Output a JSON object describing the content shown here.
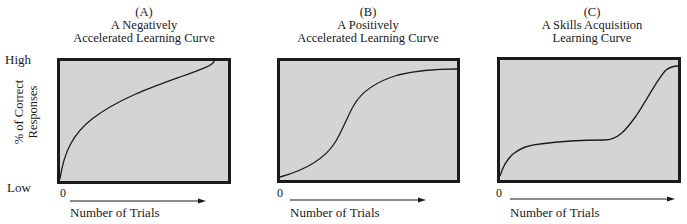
{
  "y_axis": {
    "high_label": "High",
    "low_label": "Low",
    "title_line1": "% of Correct",
    "title_line2": "Responses"
  },
  "panels": [
    {
      "letter": "(A)",
      "title_line1": "A Negatively",
      "title_line2": "Accelerated Learning Curve",
      "origin_label": "0",
      "x_label": "Number of Trials",
      "curve_shape": "negatively-accelerated"
    },
    {
      "letter": "(B)",
      "title_line1": "A Positively",
      "title_line2": "Accelerated Learning Curve",
      "origin_label": "0",
      "x_label": "Number of Trials",
      "curve_shape": "sigmoid"
    },
    {
      "letter": "(C)",
      "title_line1": "A Skills Acquisition",
      "title_line2": "Learning Curve",
      "origin_label": "0",
      "x_label": "Number of Trials",
      "curve_shape": "rise-plateau-rise"
    }
  ],
  "colors": {
    "plot_background": "#d4d4d4",
    "frame": "#1b1b1b",
    "curve": "#1b1b1b"
  }
}
